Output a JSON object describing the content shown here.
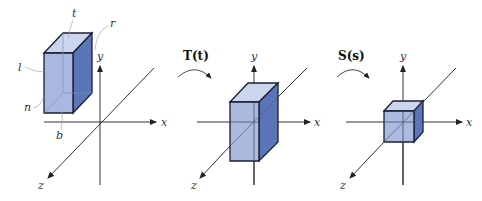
{
  "diagram": {
    "title": "",
    "panels": [
      {
        "id": "original",
        "axis_labels": {
          "x": "x",
          "y": "y",
          "z": "z"
        },
        "face_labels": {
          "top": "t",
          "right": "r",
          "left": "l",
          "near": "n",
          "bottom": "b"
        }
      },
      {
        "id": "translated",
        "operator": "T(t)",
        "axis_labels": {
          "x": "x",
          "y": "y",
          "z": "z"
        }
      },
      {
        "id": "scaled",
        "operator": "S(s)",
        "axis_labels": {
          "x": "x",
          "y": "y",
          "z": "z"
        }
      }
    ],
    "colors": {
      "front_face": "#9fb0da",
      "side_face": "#5b76b8",
      "top_face": "#cbd5ee",
      "edge": "#1a1f33",
      "axis": "#333333"
    }
  }
}
